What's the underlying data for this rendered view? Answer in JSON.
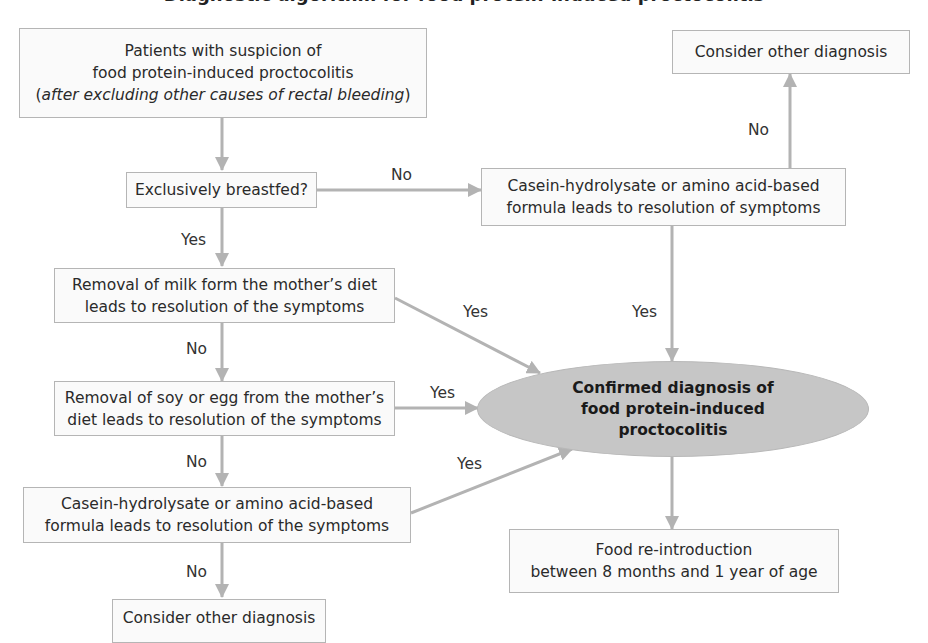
{
  "title": "Diagnostic algorithm for food protein-induced proctocolitis",
  "colors": {
    "box_fill": "#fafafa",
    "box_border": "#b5b5b5",
    "arrow": "#b3b3b3",
    "ellipse_fill": "#c6c6c6",
    "text": "#2a2a2a"
  },
  "nodes": {
    "start": {
      "line1": "Patients with suspicion of",
      "line2": "food protein-induced proctocolitis",
      "line3_open": "(",
      "line3_italic": "after excluding other causes of rectal bleeding",
      "line3_close": ")"
    },
    "breastfed": {
      "line1": "Exclusively breastfed?"
    },
    "formula_right": {
      "line1": "Casein-hydrolysate or amino acid-based",
      "line2": "formula leads to resolution of symptoms"
    },
    "other_dx_top": {
      "line1": "Consider other diagnosis"
    },
    "milk_removal": {
      "line1": "Removal of milk form the mother’s diet",
      "line2": "leads to resolution of the symptoms"
    },
    "soy_egg_removal": {
      "line1": "Removal of soy or egg from the mother’s",
      "line2": "diet leads to resolution of the symptoms"
    },
    "formula_left": {
      "line1": "Casein-hydrolysate or amino acid-based",
      "line2": "formula leads to resolution of the symptoms"
    },
    "other_dx_bottom": {
      "line1": "Consider other diagnosis"
    },
    "confirmed": {
      "line1": "Confirmed diagnosis of",
      "line2": "food protein-induced",
      "line3": "proctocolitis"
    },
    "reintroduction": {
      "line1": "Food re-introduction",
      "line2": "between 8 months and 1 year of age"
    }
  },
  "edge_labels": {
    "breastfed_no": "No",
    "breastfed_yes": "Yes",
    "formula_right_no": "No",
    "formula_right_yes": "Yes",
    "milk_yes": "Yes",
    "milk_no": "No",
    "soy_yes": "Yes",
    "soy_no": "No",
    "formula_left_yes": "Yes",
    "formula_left_no": "No"
  }
}
